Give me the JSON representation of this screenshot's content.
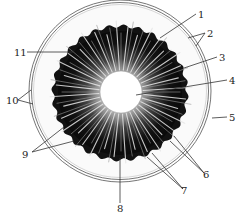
{
  "diagram": {
    "type": "eye-iris-schematic",
    "colors": {
      "background": "#ffffff",
      "iris": "#141414",
      "rays": "#d8d8d8",
      "pupil": "#ffffff",
      "ring": "#555555",
      "leader": "#333333"
    },
    "geometry": {
      "ring": {
        "cx": 120,
        "cy": 91,
        "r_outer": 91,
        "r_inner": 88
      },
      "iris": {
        "cx": 120,
        "cy": 93,
        "r": 67
      },
      "pupil": {
        "cx": 121,
        "cy": 92,
        "r": 21
      }
    },
    "labels": [
      {
        "id": "1",
        "text": "1",
        "x": 198,
        "y": 18
      },
      {
        "id": "2",
        "text": "2",
        "x": 207,
        "y": 37
      },
      {
        "id": "3",
        "text": "3",
        "x": 219,
        "y": 61
      },
      {
        "id": "4",
        "text": "4",
        "x": 229,
        "y": 84
      },
      {
        "id": "5",
        "text": "5",
        "x": 229,
        "y": 121
      },
      {
        "id": "6",
        "text": "6",
        "x": 203,
        "y": 178
      },
      {
        "id": "7",
        "text": "7",
        "x": 181,
        "y": 194
      },
      {
        "id": "8",
        "text": "8",
        "x": 117,
        "y": 212
      },
      {
        "id": "9",
        "text": "9",
        "x": 22,
        "y": 158
      },
      {
        "id": "10",
        "text": "10",
        "x": 6,
        "y": 104
      },
      {
        "id": "11",
        "text": "11",
        "x": 14,
        "y": 56
      }
    ]
  }
}
